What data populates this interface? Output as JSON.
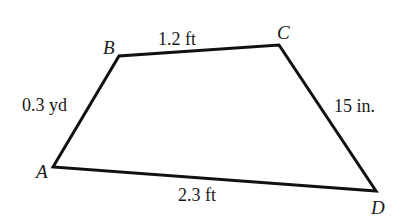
{
  "figure": {
    "type": "quadrilateral",
    "vertices": [
      {
        "name": "A",
        "x": 53,
        "y": 167,
        "label_x": 36,
        "label_y": 178
      },
      {
        "name": "B",
        "x": 119,
        "y": 56,
        "label_x": 103,
        "label_y": 54
      },
      {
        "name": "C",
        "x": 279,
        "y": 45,
        "label_x": 277,
        "label_y": 39
      },
      {
        "name": "D",
        "x": 376,
        "y": 191,
        "label_x": 371,
        "label_y": 214
      }
    ],
    "sides": [
      {
        "from": "A",
        "to": "B",
        "label": "0.3 yd",
        "label_x": 22,
        "label_y": 111
      },
      {
        "from": "B",
        "to": "C",
        "label": "1.2 ft",
        "label_x": 158,
        "label_y": 45
      },
      {
        "from": "C",
        "to": "D",
        "label": "15 in.",
        "label_x": 334,
        "label_y": 112
      },
      {
        "from": "D",
        "to": "A",
        "label": "2.3 ft",
        "label_x": 178,
        "label_y": 201
      }
    ],
    "stroke_color": "#111111",
    "background": "#ffffff"
  }
}
